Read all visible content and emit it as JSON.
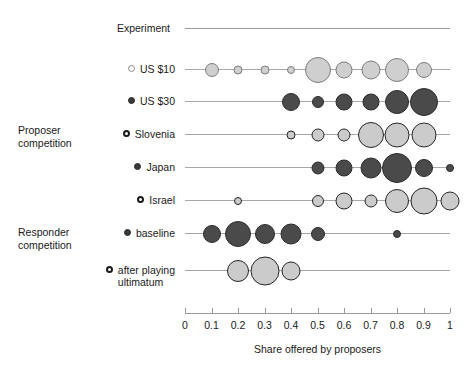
{
  "header": {
    "label": "Experiment"
  },
  "groups": [
    {
      "name": "proposer-competition",
      "label": "Proposer\ncompetition"
    },
    {
      "name": "responder-competition",
      "label": "Responder\ncompetition"
    }
  ],
  "axis": {
    "title": "Share offered by proposers",
    "ticks": [
      "0",
      "0.1",
      "0.2",
      "0.3",
      "0.4",
      "0.5",
      "0.6",
      "0.7",
      "0.8",
      "0.9",
      "1"
    ],
    "min": 0,
    "max": 1
  },
  "colors": {
    "light_fill": "#cfcfcf",
    "light_stroke": "#7d7d7d",
    "dark_fill": "#4a4a4a",
    "dark_stroke": "#2b2b2b",
    "outline_fill": "#cbcbcb",
    "outline_stroke": "#262626",
    "rule": "#a8a8a8",
    "text": "#1a1a1a"
  },
  "chart_data": {
    "type": "scatter",
    "title": "",
    "subtitle": "",
    "xlabel": "Share offered by proposers",
    "ylabel": "",
    "xlim": [
      0,
      1
    ],
    "xticks": [
      0,
      0.1,
      0.2,
      0.3,
      0.4,
      0.5,
      0.6,
      0.7,
      0.8,
      0.9,
      1
    ],
    "grid": false,
    "legend": "none",
    "note": "Bubble (dot) plot: bubble area encodes relative frequency of each offer share within a row.",
    "series": [
      {
        "name": "US $10",
        "group": "Proposer competition",
        "marker": "open-circle",
        "style": "light",
        "x": [
          0.1,
          0.2,
          0.3,
          0.4,
          0.5,
          0.6,
          0.7,
          0.8,
          0.9
        ],
        "sizes": [
          7,
          4.5,
          4.5,
          4,
          13,
          8.5,
          9.5,
          12,
          8
        ]
      },
      {
        "name": "US $30",
        "group": "Proposer competition",
        "marker": "filled-circle",
        "style": "dark",
        "x": [
          0.4,
          0.5,
          0.6,
          0.7,
          0.8,
          0.9
        ],
        "sizes": [
          9,
          6,
          8.5,
          8.5,
          12,
          14
        ]
      },
      {
        "name": "Slovenia",
        "group": "Proposer competition",
        "marker": "ring-circle",
        "style": "outline",
        "x": [
          0.4,
          0.5,
          0.6,
          0.7,
          0.8,
          0.9
        ],
        "sizes": [
          4.5,
          6.5,
          6.5,
          13,
          12.5,
          12.5
        ]
      },
      {
        "name": "Japan",
        "group": "Proposer competition",
        "marker": "filled-circle",
        "style": "dark",
        "x": [
          0.5,
          0.6,
          0.7,
          0.8,
          0.9,
          1.0
        ],
        "sizes": [
          6.5,
          8.5,
          10.5,
          15,
          9,
          4
        ]
      },
      {
        "name": "Israel",
        "group": "Proposer competition",
        "marker": "ring-circle",
        "style": "outline",
        "x": [
          0.2,
          0.5,
          0.6,
          0.7,
          0.8,
          0.9,
          1.0
        ],
        "sizes": [
          4,
          6,
          8.5,
          6.5,
          12,
          13.5,
          9.5
        ]
      },
      {
        "name": "baseline",
        "group": "Responder competition",
        "marker": "filled-circle",
        "style": "dark",
        "x": [
          0.1,
          0.2,
          0.3,
          0.4,
          0.5,
          0.8
        ],
        "sizes": [
          9,
          13,
          10,
          10.5,
          7,
          4
        ]
      },
      {
        "name": "after playing\nultimatum",
        "group": "Responder competition",
        "marker": "ring-circle",
        "style": "outline",
        "x": [
          0.2,
          0.3,
          0.4
        ],
        "sizes": [
          11,
          14.5,
          9.5
        ]
      }
    ]
  }
}
